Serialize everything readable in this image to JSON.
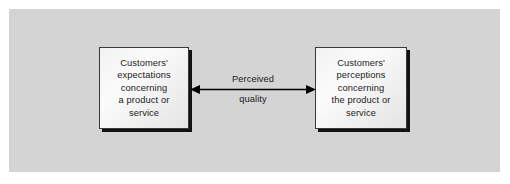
{
  "diagram": {
    "panel_color": "#d4d4d4",
    "page_background": "#ffffff",
    "box_border_color": "#3a3a3a",
    "shadow_color": "#121212",
    "text_color": "#1b1b1b",
    "boxes": [
      {
        "id": "expectations",
        "text": "Customers'\nexpectations\nconcerning\na product or\nservice"
      },
      {
        "id": "perceptions",
        "text": "Customers'\nperceptions\nconcerning\nthe product or\nservice"
      }
    ],
    "connector": {
      "type": "double-headed-arrow",
      "label_line1": "Perceived",
      "label_line2": "quality",
      "color": "#000000"
    }
  }
}
